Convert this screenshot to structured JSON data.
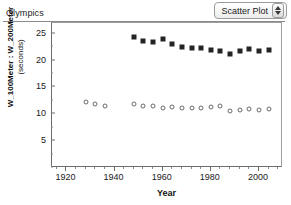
{
  "window": {
    "title": "Olympics"
  },
  "toolbar": {
    "plot_type_label": "Scatter Plot",
    "stepper_up_icon": "triangle-up-icon",
    "stepper_down_icon": "triangle-down-icon"
  },
  "colors": {
    "square_marker": "#242424",
    "circle_marker": "#6a6a6a",
    "axis": "#6d6d6d",
    "background": "#ffffff"
  },
  "chart_data": {
    "type": "scatter",
    "title": "Olympics",
    "xlabel": "Year",
    "ylabel": "W_100Meter : W_200Meter (seconds)",
    "ylabel_line1": "W_100Meter : W_200Meter",
    "ylabel_line2": "(seconds)",
    "xlim": [
      1914,
      2010
    ],
    "ylim": [
      0,
      27
    ],
    "grid": false,
    "legend_position": "none",
    "xticks": [
      1920,
      1940,
      1960,
      1980,
      2000
    ],
    "xtick_labels": [
      "1920",
      "1940",
      "1960",
      "1980",
      "2000"
    ],
    "xtick_minor_step": 4,
    "yticks": [
      5,
      10,
      15,
      20,
      25
    ],
    "ytick_labels": [
      "5",
      "10",
      "15",
      "20",
      "25"
    ],
    "ytick_minor_step": 2.5,
    "series": [
      {
        "name": "W_200Meter",
        "marker": "square",
        "color": "#242424",
        "points": [
          {
            "x": 1948,
            "y": 24.4
          },
          {
            "x": 1952,
            "y": 23.7
          },
          {
            "x": 1956,
            "y": 23.4
          },
          {
            "x": 1960,
            "y": 24.0
          },
          {
            "x": 1964,
            "y": 23.0
          },
          {
            "x": 1968,
            "y": 22.5
          },
          {
            "x": 1972,
            "y": 22.4
          },
          {
            "x": 1976,
            "y": 22.4
          },
          {
            "x": 1980,
            "y": 22.0
          },
          {
            "x": 1984,
            "y": 21.8
          },
          {
            "x": 1988,
            "y": 21.3
          },
          {
            "x": 1992,
            "y": 21.8
          },
          {
            "x": 1996,
            "y": 22.1
          },
          {
            "x": 2000,
            "y": 21.8
          },
          {
            "x": 2004,
            "y": 22.0
          }
        ]
      },
      {
        "name": "W_100Meter",
        "marker": "circle",
        "color": "#6a6a6a",
        "points": [
          {
            "x": 1928,
            "y": 12.2
          },
          {
            "x": 1932,
            "y": 11.9
          },
          {
            "x": 1936,
            "y": 11.6
          },
          {
            "x": 1948,
            "y": 11.9
          },
          {
            "x": 1952,
            "y": 11.6
          },
          {
            "x": 1956,
            "y": 11.6
          },
          {
            "x": 1960,
            "y": 11.1
          },
          {
            "x": 1964,
            "y": 11.4
          },
          {
            "x": 1968,
            "y": 11.1
          },
          {
            "x": 1972,
            "y": 11.1
          },
          {
            "x": 1976,
            "y": 11.1
          },
          {
            "x": 1980,
            "y": 11.4
          },
          {
            "x": 1984,
            "y": 11.6
          },
          {
            "x": 1988,
            "y": 10.6
          },
          {
            "x": 1992,
            "y": 10.8
          },
          {
            "x": 1996,
            "y": 10.9
          },
          {
            "x": 2000,
            "y": 10.8
          },
          {
            "x": 2004,
            "y": 10.9
          }
        ]
      }
    ]
  }
}
